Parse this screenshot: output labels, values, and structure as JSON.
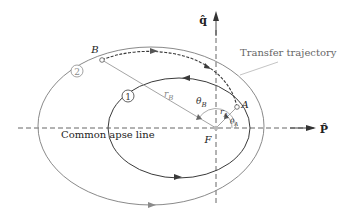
{
  "diagram": {
    "colors": {
      "orbit1": "#3a3a3a",
      "orbit2": "#8a8a8a",
      "transfer": "#3a3a3a",
      "axes": "#555555",
      "radius_lines": "#9a9a9a",
      "label_grey": "#7a7a7a",
      "text": "#222222"
    },
    "labels": {
      "q_axis": "q̂",
      "p_axis": "P̂",
      "transfer_trajectory": "Transfer trajectory",
      "common_apse_line": "Common apse line",
      "focus": "F",
      "point_A": "A",
      "point_B": "B",
      "r_A": "r",
      "r_A_sub": "A",
      "r_B": "r",
      "r_B_sub": "B",
      "theta_A": "θ",
      "theta_A_sub": "A",
      "theta_B": "θ",
      "theta_B_sub": "B",
      "orbit1_marker": "1",
      "orbit2_marker": "2"
    }
  }
}
